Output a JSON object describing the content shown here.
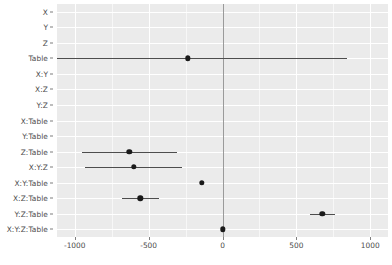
{
  "chart_data": {
    "type": "scatter",
    "title": "",
    "subtitle": "",
    "xlabel": "",
    "ylabel": "",
    "grid": true,
    "legend": null,
    "orientation": "horizontal",
    "xlim": [
      -1120,
      1120
    ],
    "x_ticks": [
      -1000,
      -500,
      0,
      500,
      1000
    ],
    "x_tick_labels": [
      "-1000",
      "-500",
      "0",
      "500",
      "1000"
    ],
    "reference_line_x": 0,
    "categories": [
      "X",
      "Y",
      "Z",
      "Table",
      "X:Y",
      "X:Z",
      "Y:Z",
      "X:Table",
      "Y:Table",
      "Z:Table",
      "X:Y:Z",
      "X:Y:Table",
      "X:Z:Table",
      "Y:Z:Table",
      "X:Y:Z:Table"
    ],
    "points": [
      {
        "category": "X",
        "value": null,
        "low": null,
        "high": null,
        "visible": false
      },
      {
        "category": "Y",
        "value": null,
        "low": null,
        "high": null,
        "visible": false
      },
      {
        "category": "Z",
        "value": null,
        "low": null,
        "high": null,
        "visible": false
      },
      {
        "category": "Table",
        "value": -235,
        "low": -1120,
        "high": 845,
        "visible": true
      },
      {
        "category": "X:Y",
        "value": null,
        "low": null,
        "high": null,
        "visible": false
      },
      {
        "category": "X:Z",
        "value": null,
        "low": null,
        "high": null,
        "visible": false
      },
      {
        "category": "Y:Z",
        "value": null,
        "low": null,
        "high": null,
        "visible": false
      },
      {
        "category": "X:Table",
        "value": null,
        "low": null,
        "high": null,
        "visible": false
      },
      {
        "category": "Y:Table",
        "value": null,
        "low": null,
        "high": null,
        "visible": false
      },
      {
        "category": "Z:Table",
        "value": -630,
        "low": -950,
        "high": -310,
        "visible": true
      },
      {
        "category": "X:Y:Z",
        "value": -600,
        "low": -930,
        "high": -275,
        "visible": true
      },
      {
        "category": "X:Y:Table",
        "value": -140,
        "low": -140,
        "high": -140,
        "visible": true
      },
      {
        "category": "X:Z:Table",
        "value": -555,
        "low": -680,
        "high": -430,
        "visible": true
      },
      {
        "category": "Y:Z:Table",
        "value": 675,
        "low": 595,
        "high": 760,
        "visible": true
      },
      {
        "category": "X:Y:Z:Table",
        "value": 0,
        "low": 0,
        "high": 0,
        "visible": true
      }
    ],
    "colors": {
      "panel_background": "#ebebeb",
      "gridline_major": "#ffffff",
      "gridline_minor": "#f7f7f7",
      "point": "#1a1a1a",
      "errorbar": "#4d4d4d",
      "zero_line": "#9a9a9a",
      "axis_text": "#4d4d4d",
      "figure_background": "#ffffff"
    }
  }
}
